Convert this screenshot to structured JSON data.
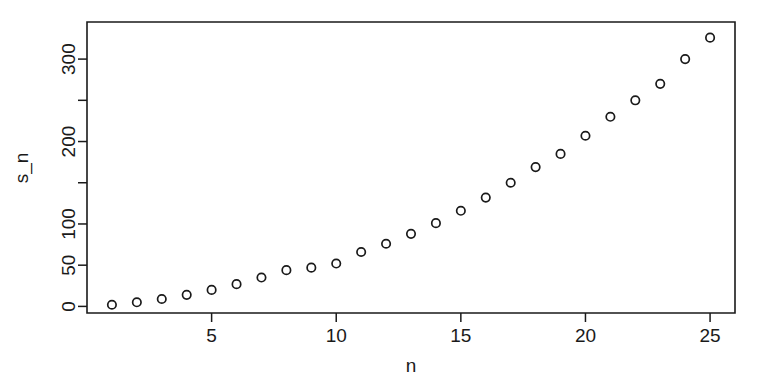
{
  "chart_data": {
    "type": "scatter",
    "title": "",
    "xlabel": "n",
    "ylabel": "s_n",
    "x": [
      1,
      2,
      3,
      4,
      5,
      6,
      7,
      8,
      9,
      10,
      11,
      12,
      13,
      14,
      15,
      16,
      17,
      18,
      19,
      20,
      21,
      22,
      23,
      24,
      25
    ],
    "values": [
      2,
      5,
      9,
      14,
      20,
      27,
      35,
      44,
      52,
      52,
      66,
      76,
      88,
      101,
      116,
      132,
      150,
      169,
      185,
      207,
      230,
      250,
      270,
      300,
      326
    ],
    "y": [
      2,
      5,
      9,
      14,
      20,
      27,
      35,
      44,
      47,
      52,
      66,
      76,
      88,
      101,
      116,
      132,
      150,
      169,
      185,
      207,
      230,
      250,
      270,
      300,
      326
    ],
    "xlim": [
      0.0,
      26.0
    ],
    "ylim": [
      -8,
      345
    ],
    "x_ticks": [
      5,
      10,
      15,
      20,
      25
    ],
    "x_tick_labels": [
      "5",
      "10",
      "15",
      "20",
      "25"
    ],
    "y_ticks": [
      0,
      50,
      100,
      150,
      200,
      250,
      300
    ],
    "y_tick_labels": [
      "0",
      "50",
      "100",
      "150",
      "200",
      "250",
      "300"
    ],
    "y_tick_labels_shown": [
      "0",
      "50",
      "100",
      "",
      "200",
      "",
      "300"
    ],
    "grid": false,
    "legend": false,
    "marker": "open-circle",
    "marker_color": "#1a1a1a",
    "background_color": "#ffffff",
    "axis_color": "#1a1a1a",
    "box_frame": true
  },
  "plot": {
    "x_axis_label": "n",
    "y_axis_label": "s_n"
  }
}
